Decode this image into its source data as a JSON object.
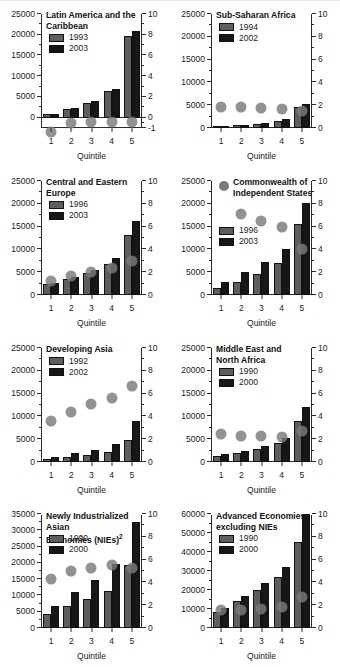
{
  "figure": {
    "xlabel": "Quintile",
    "categories": [
      "1",
      "2",
      "3",
      "4",
      "5"
    ],
    "colors": {
      "series_early": "#5e5e5e",
      "series_late": "#171717",
      "dot": "#7a7a7a",
      "axis": "#2b2b2b"
    }
  },
  "chart_data": [
    {
      "type": "bar",
      "title": "Latin America and the Caribbean",
      "title_lines": [
        "Latin America and the",
        "Caribbean"
      ],
      "xlabel": "Quintile",
      "ylabel": "",
      "categories": [
        "1",
        "2",
        "3",
        "4",
        "5"
      ],
      "series": [
        {
          "name": "1993",
          "values": [
            800,
            2000,
            3600,
            6400,
            19700
          ]
        },
        {
          "name": "2003",
          "values": [
            900,
            2300,
            4000,
            7000,
            20900
          ]
        }
      ],
      "dots": {
        "name": "ratio",
        "values": [
          -0.4,
          0.5,
          0.6,
          0.6,
          0.6
        ]
      },
      "ylim": [
        0,
        25000
      ],
      "yticks": [
        0,
        5000,
        10000,
        15000,
        20000,
        25000
      ],
      "ylim_right": [
        -1,
        10
      ],
      "yticks_right": [
        -1,
        0,
        2,
        4,
        6,
        8,
        10
      ],
      "grid": false,
      "legend_position": "top-left"
    },
    {
      "type": "bar",
      "title": "Sub-Saharan Africa",
      "title_lines": [
        "Sub-Saharan Africa"
      ],
      "xlabel": "Quintile",
      "ylabel": "",
      "categories": [
        "1",
        "2",
        "3",
        "4",
        "5"
      ],
      "series": [
        {
          "name": "1994",
          "values": [
            300,
            600,
            900,
            1600,
            4700
          ]
        },
        {
          "name": "2002",
          "values": [
            350,
            700,
            1100,
            1900,
            5200
          ]
        }
      ],
      "dots": {
        "name": "ratio",
        "values": [
          1.8,
          1.8,
          1.75,
          1.7,
          1.5
        ]
      },
      "ylim": [
        0,
        25000
      ],
      "yticks": [
        0,
        5000,
        10000,
        15000,
        20000,
        25000
      ],
      "ylim_right": [
        0,
        10
      ],
      "yticks_right": [
        0,
        2,
        4,
        6,
        8,
        10
      ],
      "grid": false,
      "legend_position": "top-left"
    },
    {
      "type": "bar",
      "title": "Central and Eastern Europe",
      "title_lines": [
        "Central and Eastern",
        "Europe"
      ],
      "xlabel": "Quintile",
      "ylabel": "",
      "categories": [
        "1",
        "2",
        "3",
        "4",
        "5"
      ],
      "series": [
        {
          "name": "1996",
          "values": [
            2400,
            3600,
            4900,
            6900,
            13200
          ]
        },
        {
          "name": "2003",
          "values": [
            2700,
            4000,
            5400,
            8100,
            16300
          ]
        }
      ],
      "dots": {
        "name": "ratio",
        "values": [
          1.2,
          1.7,
          2.0,
          2.4,
          3.0
        ]
      },
      "ylim": [
        0,
        25000
      ],
      "yticks": [
        0,
        5000,
        10000,
        15000,
        20000,
        25000
      ],
      "ylim_right": [
        0,
        10
      ],
      "yticks_right": [
        0,
        2,
        4,
        6,
        8,
        10
      ],
      "grid": false,
      "legend_position": "top-left"
    },
    {
      "type": "bar",
      "title": "Commonwealth of Independent States",
      "title_lines": [
        "Commonwealth of",
        "Independent States"
      ],
      "xlabel": "Quintile",
      "ylabel": "",
      "categories": [
        "1",
        "2",
        "3",
        "4",
        "5"
      ],
      "series": [
        {
          "name": "1996",
          "values": [
            1500,
            2800,
            4700,
            7000,
            15600
          ]
        },
        {
          "name": "2003",
          "values": [
            2900,
            5000,
            7300,
            10200,
            20200
          ]
        }
      ],
      "dots": {
        "name": "ratio",
        "values": [
          null,
          7.1,
          6.5,
          6.0,
          4.0
        ]
      },
      "ylim": [
        0,
        25000
      ],
      "yticks": [
        0,
        5000,
        10000,
        15000,
        20000,
        25000
      ],
      "ylim_right": [
        0,
        10
      ],
      "yticks_right": [
        0,
        2,
        4,
        6,
        8,
        10
      ],
      "grid": false,
      "legend_position": "middle-left",
      "legend_has_dot": true
    },
    {
      "type": "bar",
      "title": "Developing Asia",
      "title_lines": [
        "Developing Asia"
      ],
      "xlabel": "Quintile",
      "ylabel": "",
      "categories": [
        "1",
        "2",
        "3",
        "4",
        "5"
      ],
      "series": [
        {
          "name": "1992",
          "values": [
            600,
            1000,
            1500,
            2200,
            4800
          ]
        },
        {
          "name": "2002",
          "values": [
            1100,
            1900,
            2600,
            3900,
            9100
          ]
        }
      ],
      "dots": {
        "name": "ratio",
        "values": [
          3.6,
          4.4,
          5.1,
          5.6,
          6.7
        ]
      },
      "ylim": [
        0,
        25000
      ],
      "yticks": [
        0,
        5000,
        10000,
        15000,
        20000,
        25000
      ],
      "ylim_right": [
        0,
        10
      ],
      "yticks_right": [
        0,
        2,
        4,
        6,
        8,
        10
      ],
      "grid": false,
      "legend_position": "top-left"
    },
    {
      "type": "bar",
      "title": "Middle East and North Africa",
      "title_lines": [
        "Middle East and",
        "North Africa"
      ],
      "xlabel": "Quintile",
      "ylabel": "",
      "categories": [
        "1",
        "2",
        "3",
        "4",
        "5"
      ],
      "series": [
        {
          "name": "1990",
          "values": [
            1300,
            2000,
            2800,
            4200,
            8900
          ]
        },
        {
          "name": "2000",
          "values": [
            1700,
            2500,
            3500,
            5300,
            12100
          ]
        }
      ],
      "dots": {
        "name": "ratio",
        "values": [
          2.5,
          2.3,
          2.3,
          2.2,
          2.7
        ]
      },
      "ylim": [
        0,
        25000
      ],
      "yticks": [
        0,
        5000,
        10000,
        15000,
        20000,
        25000
      ],
      "ylim_right": [
        0,
        10
      ],
      "yticks_right": [
        0,
        2,
        4,
        6,
        8,
        10
      ],
      "grid": false,
      "legend_position": "top-left"
    },
    {
      "type": "bar",
      "title": "Newly Industrialized Asian Economies (NIEs)",
      "title_lines": [
        "Newly Industrialized Asian",
        "Economies (NIEs)"
      ],
      "title_superscript": "2",
      "xlabel": "Quintile",
      "ylabel": "",
      "categories": [
        "1",
        "2",
        "3",
        "4",
        "5"
      ],
      "series": [
        {
          "name": "1990",
          "values": [
            4300,
            6700,
            8800,
            11500,
            19200
          ]
        },
        {
          "name": "2000",
          "values": [
            6800,
            11000,
            14700,
            19600,
            32700
          ]
        }
      ],
      "dots": {
        "name": "ratio",
        "values": [
          4.3,
          5.0,
          5.3,
          5.5,
          5.3
        ]
      },
      "ylim": [
        0,
        35000
      ],
      "yticks": [
        0,
        5000,
        10000,
        15000,
        20000,
        25000,
        30000,
        35000
      ],
      "ylim_right": [
        0,
        10
      ],
      "yticks_right": [
        0,
        2,
        4,
        6,
        8,
        10
      ],
      "grid": false,
      "legend_position": "top-left"
    },
    {
      "type": "bar",
      "title": "Advanced Economies, excluding NIEs",
      "title_lines": [
        "Advanced Economies,",
        "excluding NIEs"
      ],
      "xlabel": "Quintile",
      "ylabel": "",
      "categories": [
        "1",
        "2",
        "3",
        "4",
        "5"
      ],
      "series": [
        {
          "name": "1990",
          "values": [
            8300,
            14200,
            20100,
            26900,
            45400
          ]
        },
        {
          "name": "2000",
          "values": [
            10300,
            16900,
            23900,
            32100,
            60000
          ]
        }
      ],
      "dots": {
        "name": "ratio",
        "values": [
          1.6,
          1.6,
          1.7,
          1.8,
          2.7
        ]
      },
      "ylim": [
        0,
        60000
      ],
      "yticks": [
        0,
        10000,
        20000,
        30000,
        40000,
        50000,
        60000
      ],
      "ylim_right": [
        0,
        10
      ],
      "yticks_right": [
        0,
        2,
        4,
        6,
        8,
        10
      ],
      "grid": false,
      "legend_position": "top-left"
    }
  ]
}
